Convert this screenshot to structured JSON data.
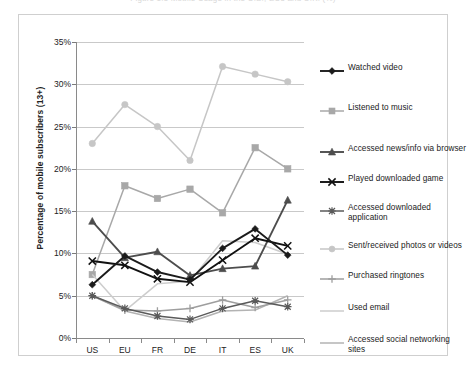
{
  "figure": {
    "title": "Figure 1.5    Mobile Usage in the U.S., EU5 and U.K. (%)"
  },
  "chart_data": {
    "type": "line",
    "title": "Figure 1.5    Mobile Usage in the U.S., EU5 and U.K. (%)",
    "xlabel": "",
    "ylabel": "Percentage of mobile subscribers (13+)",
    "ylim": [
      0,
      35
    ],
    "ytick_labels": [
      "0%",
      "5%",
      "10%",
      "15%",
      "20%",
      "25%",
      "30%",
      "35%"
    ],
    "ytick_values": [
      0,
      5,
      10,
      15,
      20,
      25,
      30,
      35
    ],
    "grid": true,
    "legend_position": "right",
    "categories": [
      "US",
      "EU",
      "FR",
      "DE",
      "IT",
      "ES",
      "UK"
    ],
    "series": [
      {
        "name": "Watched video",
        "color": "#1b1b1b",
        "marker": "diamond",
        "values": [
          6.3,
          9.7,
          7.8,
          6.9,
          10.6,
          12.9,
          9.8
        ]
      },
      {
        "name": "Listened to music",
        "color": "#a8a8a8",
        "marker": "square",
        "values": [
          7.5,
          18.0,
          16.5,
          17.6,
          14.8,
          22.5,
          20.0
        ]
      },
      {
        "name": "Accessed news/info via browser",
        "color": "#4d4d4d",
        "marker": "triangle",
        "values": [
          13.8,
          9.5,
          10.2,
          7.4,
          8.2,
          8.5,
          16.3
        ]
      },
      {
        "name": "Played downloaded game",
        "color": "#111111",
        "marker": "cross-x",
        "values": [
          9.1,
          8.6,
          7.0,
          6.6,
          9.2,
          11.8,
          10.9
        ]
      },
      {
        "name": "Accessed downloaded application",
        "color": "#5a5a5a",
        "marker": "star-x",
        "values": [
          5.0,
          3.5,
          2.6,
          2.2,
          3.5,
          4.4,
          3.7
        ]
      },
      {
        "name": "Sent/received photos or videos",
        "color": "#c6c6c6",
        "marker": "circle",
        "values": [
          23.0,
          27.6,
          25.0,
          21.0,
          32.1,
          31.2,
          30.3
        ]
      },
      {
        "name": "Purchased ringtones",
        "color": "#9e9e9e",
        "marker": "plus",
        "values": [
          5.0,
          3.3,
          3.2,
          3.5,
          4.5,
          3.6,
          4.5
        ]
      },
      {
        "name": "Used email",
        "color": "#cdcdcd",
        "marker": "none",
        "values": [
          7.5,
          3.2,
          6.4,
          6.7,
          11.5,
          11.3,
          9.9
        ]
      },
      {
        "name": "Accessed social networking sites",
        "color": "#b3b3b3",
        "marker": "none",
        "values": [
          5.0,
          3.2,
          2.3,
          1.9,
          3.2,
          3.3,
          5.0
        ]
      }
    ]
  }
}
